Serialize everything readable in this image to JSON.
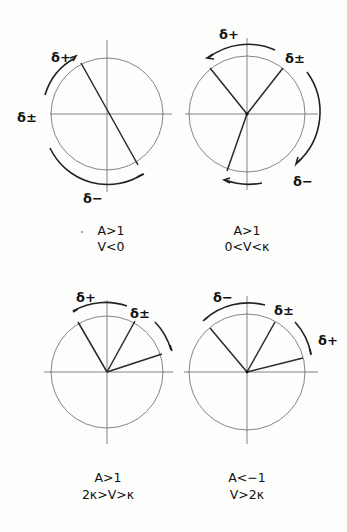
{
  "diagrams": [
    {
      "id": "d1",
      "cx": 107,
      "cy": 114,
      "r": 56,
      "caption": [
        "A>1",
        "V<0"
      ],
      "labels": {
        "delta_plus": "δ+",
        "delta_pm": "δ±",
        "delta_minus": "δ−"
      },
      "rays_deg": [
        118,
        -62
      ]
    },
    {
      "id": "d2",
      "cx": 247,
      "cy": 114,
      "r": 58,
      "caption": [
        "A>1",
        "0<V<κ"
      ],
      "labels": {
        "delta_plus": "δ+",
        "delta_pm": "δ±",
        "delta_minus": "δ−"
      },
      "rays_deg": [
        126,
        56,
        -110
      ]
    },
    {
      "id": "d3",
      "cx": 107,
      "cy": 372,
      "r": 56,
      "caption": [
        "A>1",
        "2κ>V>κ"
      ],
      "labels": {
        "delta_plus": "δ+",
        "delta_pm": "δ±"
      },
      "rays_deg": [
        120,
        62,
        18
      ]
    },
    {
      "id": "d4",
      "cx": 247,
      "cy": 372,
      "r": 58,
      "caption": [
        "A<−1",
        "V>2κ"
      ],
      "labels": {
        "delta_minus": "δ−",
        "delta_pm": "δ±",
        "delta_plus": "δ+"
      },
      "rays_deg": [
        128,
        62,
        14
      ]
    }
  ]
}
